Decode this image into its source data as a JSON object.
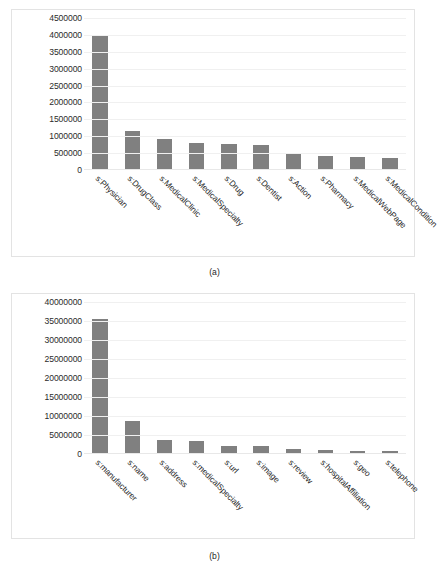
{
  "figures": [
    {
      "id": "fig-a",
      "caption": "(a)",
      "chart_data": {
        "type": "bar",
        "title": "",
        "xlabel": "",
        "ylabel": "",
        "ylim": [
          0,
          4500000
        ],
        "grid": true,
        "legend": "none",
        "orientation": "vertical",
        "bar_color": "#808080",
        "yticks": [
          0,
          500000,
          1000000,
          1500000,
          2000000,
          2500000,
          3000000,
          3500000,
          4000000,
          4500000
        ],
        "ytick_labels": [
          "0",
          "500000",
          "1000000",
          "1500000",
          "2000000",
          "2500000",
          "3000000",
          "3500000",
          "4000000",
          "4500000"
        ],
        "categories": [
          "s:Physician",
          "s:DrugClass",
          "s:MedicalClinic",
          "s:MedicalSpecialty",
          "s:Drug",
          "s:Dentist",
          "s:Action",
          "s:Pharmacy",
          "s:MedicalWebPage",
          "s:MedicalCondition"
        ],
        "values": [
          3960000,
          1160000,
          910000,
          800000,
          760000,
          750000,
          500000,
          410000,
          400000,
          360000
        ]
      }
    },
    {
      "id": "fig-b",
      "caption": "(b)",
      "chart_data": {
        "type": "bar",
        "title": "",
        "xlabel": "",
        "ylabel": "",
        "ylim": [
          0,
          40000000
        ],
        "grid": true,
        "legend": "none",
        "orientation": "vertical",
        "bar_color": "#808080",
        "yticks": [
          0,
          5000000,
          10000000,
          15000000,
          20000000,
          25000000,
          30000000,
          35000000,
          40000000
        ],
        "ytick_labels": [
          "0",
          "5000000",
          "10000000",
          "15000000",
          "20000000",
          "25000000",
          "30000000",
          "35000000",
          "40000000"
        ],
        "categories": [
          "s:manufacturer",
          "s:name",
          "s:address",
          "s:medicalSpecialty",
          "s:url",
          "s:image",
          "s:review",
          "s:hospitalAffiliation",
          "s:geo",
          "s:telephone"
        ],
        "values": [
          35600000,
          8800000,
          3700000,
          3300000,
          2200000,
          2000000,
          1200000,
          1000000,
          900000,
          800000
        ]
      }
    }
  ]
}
